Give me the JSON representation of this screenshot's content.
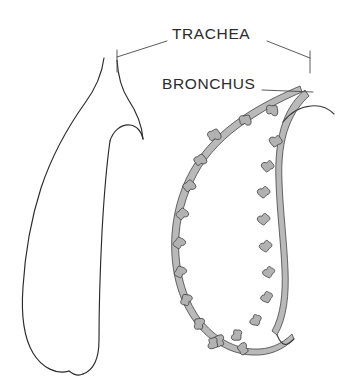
{
  "figure": {
    "kind": "anatomical-line-diagram",
    "background_color": "#ffffff",
    "ink_color": "#2a2a2a",
    "label_color": "#2b2b2b",
    "cartilage_fill_color": "#b9b9b9"
  },
  "labels": {
    "trachea": "TRACHEA",
    "bronchus": "BRONCHUS"
  },
  "annotations": [
    {
      "id": "trachea",
      "text": "TRACHEA",
      "text_x": 172,
      "text_y": 35,
      "leaders": [
        {
          "from_x": 167,
          "from_y": 41,
          "to_x": 117,
          "to_y": 57
        },
        {
          "from_x": 267,
          "from_y": 41,
          "to_x": 310,
          "to_y": 58
        }
      ],
      "ticks": [
        {
          "x": 117,
          "y1": 50,
          "y2": 72
        },
        {
          "x": 310,
          "y1": 51,
          "y2": 73
        }
      ]
    },
    {
      "id": "bronchus",
      "text": "BRONCHUS",
      "text_x": 162,
      "text_y": 85,
      "leaders": [
        {
          "from_x": 262,
          "from_y": 90,
          "to_x": 313,
          "to_y": 92
        }
      ],
      "ticks": []
    }
  ],
  "structures": [
    {
      "id": "early-lung-bud",
      "name": "Early lung bud (unbranched)",
      "side": "left",
      "description": "Smooth elongated outline with a trachea that bifurcates into two short bronchial buds at the top."
    },
    {
      "id": "branched-bronchial-tree",
      "name": "Branched bronchial tree",
      "side": "right",
      "description": "Elongated lobe outlined by a stippled cartilaginous bronchus bearing many small star-shaped terminal buds along its inner border.",
      "bud_count": 22
    }
  ],
  "buds": {
    "outer_column": [
      {
        "x": 214,
        "y": 135,
        "r": 7.0,
        "rot": 205
      },
      {
        "x": 200,
        "y": 160,
        "r": 6.6,
        "rot": 200
      },
      {
        "x": 189,
        "y": 186,
        "r": 6.6,
        "rot": 192
      },
      {
        "x": 182,
        "y": 214,
        "r": 6.4,
        "rot": 186
      },
      {
        "x": 179,
        "y": 243,
        "r": 6.4,
        "rot": 178
      },
      {
        "x": 180,
        "y": 272,
        "r": 6.4,
        "rot": 170
      },
      {
        "x": 186,
        "y": 300,
        "r": 6.4,
        "rot": 158
      },
      {
        "x": 199,
        "y": 324,
        "r": 6.4,
        "rot": 142
      },
      {
        "x": 219,
        "y": 341,
        "r": 6.4,
        "rot": 124
      },
      {
        "x": 243,
        "y": 349,
        "r": 6.2,
        "rot": 108
      }
    ],
    "crest_column": [
      {
        "x": 245,
        "y": 120,
        "r": 6.6,
        "rot": 222
      },
      {
        "x": 272,
        "y": 110,
        "r": 6.6,
        "rot": 232
      }
    ],
    "inner_column": [
      {
        "x": 276,
        "y": 141,
        "r": 6.6,
        "rot": 20
      },
      {
        "x": 268,
        "y": 166,
        "r": 6.4,
        "rot": 16
      },
      {
        "x": 264,
        "y": 192,
        "r": 6.4,
        "rot": 10
      },
      {
        "x": 264,
        "y": 219,
        "r": 6.4,
        "rot": 6
      },
      {
        "x": 266,
        "y": 246,
        "r": 6.4,
        "rot": 2
      },
      {
        "x": 269,
        "y": 272,
        "r": 6.2,
        "rot": 356
      },
      {
        "x": 267,
        "y": 297,
        "r": 6.2,
        "rot": 350
      },
      {
        "x": 256,
        "y": 320,
        "r": 6.2,
        "rot": 340
      },
      {
        "x": 237,
        "y": 335,
        "r": 6.2,
        "rot": 326
      },
      {
        "x": 213,
        "y": 343,
        "r": 6.2,
        "rot": 312
      }
    ]
  }
}
